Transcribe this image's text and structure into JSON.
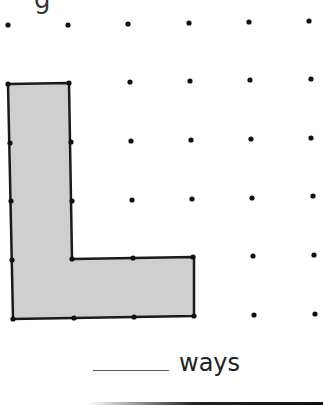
{
  "worksheet": {
    "cropped_heading_glyph": "g",
    "answer_suffix": "ways",
    "answer_value": ""
  },
  "grid": {
    "rows": 6,
    "cols": 6,
    "dot_color": "#111111",
    "points": [
      [
        [
          8,
          25
        ],
        [
          68,
          25
        ],
        [
          128,
          24
        ],
        [
          189,
          23
        ],
        [
          249,
          22
        ],
        [
          309,
          21
        ]
      ],
      [
        [
          8,
          84
        ],
        [
          69,
          83
        ],
        [
          130,
          82
        ],
        [
          190,
          81
        ],
        [
          250,
          80
        ],
        [
          311,
          79
        ]
      ],
      [
        [
          10,
          143
        ],
        [
          71,
          142
        ],
        [
          131,
          141
        ],
        [
          191,
          140
        ],
        [
          251,
          139
        ],
        [
          311,
          138
        ]
      ],
      [
        [
          11,
          201
        ],
        [
          72,
          201
        ],
        [
          132,
          200
        ],
        [
          192,
          199
        ],
        [
          252,
          198
        ],
        [
          313,
          196
        ]
      ],
      [
        [
          12,
          260
        ],
        [
          72,
          259
        ],
        [
          133,
          258
        ],
        [
          193,
          257
        ],
        [
          253,
          256
        ],
        [
          314,
          255
        ]
      ],
      [
        [
          13,
          319
        ],
        [
          74,
          318
        ],
        [
          134,
          317
        ],
        [
          194,
          316
        ],
        [
          254,
          315
        ],
        [
          315,
          314
        ]
      ]
    ]
  },
  "shape": {
    "name": "L-shape",
    "fill": "#cfcfcf",
    "stroke": "#1a1a1a",
    "vertices": [
      [
        8,
        84
      ],
      [
        69,
        83
      ],
      [
        72,
        259
      ],
      [
        194,
        257
      ],
      [
        194,
        316
      ],
      [
        13,
        319
      ]
    ]
  }
}
